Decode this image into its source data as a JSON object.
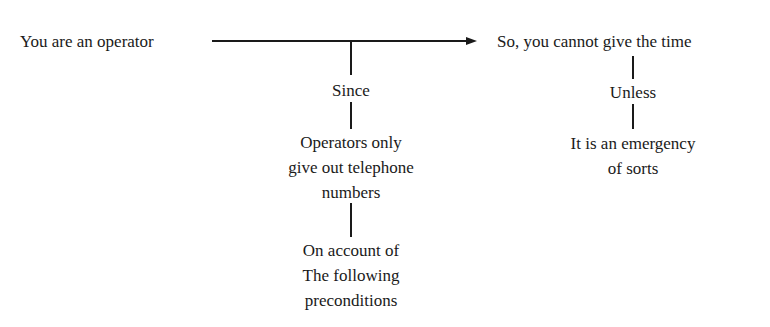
{
  "diagram": {
    "premise": "You are an operator",
    "conclusion": "So, you cannot give the time",
    "left_branch": {
      "connector": "Since",
      "warrant_lines": [
        "Operators only",
        "give out telephone",
        "numbers"
      ],
      "backing_lines": [
        "On account of",
        "The following",
        "preconditions"
      ]
    },
    "right_branch": {
      "connector": "Unless",
      "rebuttal_lines": [
        "It is an emergency",
        "of sorts"
      ]
    },
    "colors": {
      "ink": "#1a1a1a",
      "background": "#ffffff"
    }
  }
}
